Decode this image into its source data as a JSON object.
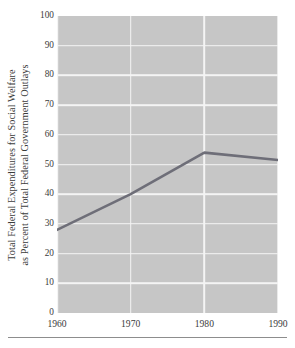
{
  "chart_data": {
    "type": "line",
    "title": "",
    "xlabel": "",
    "ylabel_lines": [
      "Total Federal Expenditures for Social Welfare",
      "as Percent of Total Federal Government Outlays"
    ],
    "ylabel": "Total Federal Expenditures for Social Welfare as Percent of Total Federal Government Outlays",
    "x": [
      1960,
      1970,
      1980,
      1990
    ],
    "values": [
      28,
      40,
      54,
      51.5
    ],
    "series": [
      {
        "name": "Total Federal Expenditures for Social Welfare as Percent of Total Federal Government Outlays",
        "values": [
          28,
          40,
          54,
          51.5
        ],
        "color": "#6e6e78"
      }
    ],
    "xlim": [
      1960,
      1990
    ],
    "ylim": [
      0,
      100
    ],
    "xticks": [
      1960,
      1970,
      1980,
      1990
    ],
    "xtick_labels": [
      "1960",
      "1970",
      "1980",
      "1990"
    ],
    "yticks": [
      0,
      10,
      20,
      30,
      40,
      50,
      60,
      70,
      80,
      90,
      100
    ],
    "ytick_labels": [
      "0",
      "10",
      "20",
      "30",
      "40",
      "50",
      "60",
      "70",
      "80",
      "90",
      "100"
    ],
    "grid": true,
    "grid_color": "#f4f4f4",
    "plot_background": "#c6c6c6",
    "legend": false,
    "legend_position": "none",
    "annotations": []
  },
  "figure": {
    "background": "#ffffff",
    "rule_color": "#8d8d8d"
  }
}
